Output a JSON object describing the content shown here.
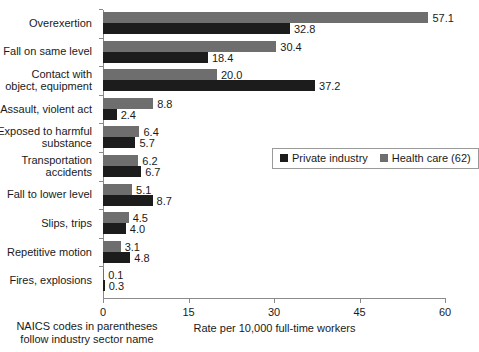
{
  "chart_data": {
    "type": "bar",
    "orientation": "horizontal",
    "grouped": true,
    "title": "",
    "xlabel": "Rate per 10,000 full-time workers",
    "ylabel": "",
    "xlim": [
      0,
      60
    ],
    "xticks": [
      "0",
      "15",
      "30",
      "45",
      "60"
    ],
    "grid": false,
    "legend_position": "middle-right",
    "categories": [
      "Overexertion",
      "Fall on same level",
      "Contact with\nobject, equipment",
      "Assault, violent act",
      "Exposed to harmful\nsubstance",
      "Transportation\naccidents",
      "Fall to lower level",
      "Slips, trips",
      "Repetitive motion",
      "Fires, explosions"
    ],
    "series": [
      {
        "name": "Health care (62)",
        "color": "#6e6e6e",
        "values": [
          57.1,
          30.4,
          20.0,
          8.8,
          6.4,
          6.2,
          5.1,
          4.5,
          3.1,
          0.1
        ],
        "labels": [
          "57.1",
          "30.4",
          "20.0",
          "8.8",
          "6.4",
          "6.2",
          "5.1",
          "4.5",
          "3.1",
          "0.1"
        ]
      },
      {
        "name": "Private industry",
        "color": "#1c1c1c",
        "values": [
          32.8,
          18.4,
          37.2,
          2.4,
          5.7,
          6.7,
          8.7,
          4.0,
          4.8,
          0.3
        ],
        "labels": [
          "32.8",
          "18.4",
          "37.2",
          "2.4",
          "5.7",
          "6.7",
          "8.7",
          "4.0",
          "4.8",
          "0.3"
        ]
      }
    ]
  },
  "legend": {
    "items": [
      {
        "label": "Private industry",
        "color": "#1c1c1c"
      },
      {
        "label": "Health care (62)",
        "color": "#6e6e6e"
      }
    ]
  },
  "axis": {
    "x_title": "Rate per 10,000 full-time workers"
  },
  "footnote": {
    "text": "NAICS codes in parentheses\nfollow industry sector name"
  }
}
